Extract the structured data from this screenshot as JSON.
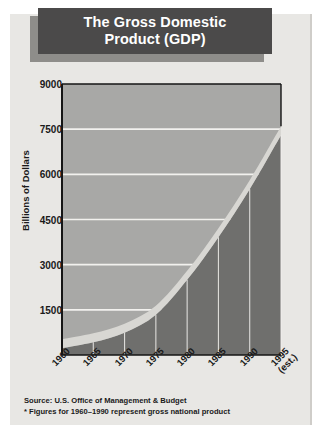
{
  "title": {
    "line1": "The Gross Domestic",
    "line2": "Product (GDP)"
  },
  "footnotes": {
    "source": "Source: U.S. Office of Management & Budget",
    "figures": "* Figures for 1960–1990 represent gross national product"
  },
  "colors": {
    "title_bg": "#4b4a4a",
    "title_shadow": "#8e8d8a",
    "title_text": "#ffffff",
    "panel_bg": "#e8e7e4",
    "plot_bg": "#a8a8a6",
    "area_fill": "#6f6f6d",
    "band_top": "#d8d7d3",
    "gridline": "#f2f1ee",
    "axis": "#151515"
  },
  "chart_data": {
    "type": "area",
    "title": "The Gross Domestic Product (GDP)",
    "xlabel": "",
    "ylabel": "Billions of Dollars",
    "categories": [
      "1960",
      "1965",
      "1970",
      "1975",
      "1980",
      "1985",
      "1990",
      "1995 (est.)"
    ],
    "x_tick_labels": [
      "1960",
      "1965",
      "1970",
      "1975",
      "1980",
      "1985",
      "1990",
      "1995"
    ],
    "x_tick_sublabels": [
      "",
      "",
      "",
      "",
      "",
      "",
      "",
      "(est.)"
    ],
    "values": [
      526,
      720,
      1039,
      1636,
      2796,
      4213,
      5803,
      7600
    ],
    "y_tick_labels": [
      "1500",
      "3000",
      "4500",
      "6000",
      "7500",
      "9000"
    ],
    "y_ticks": [
      1500,
      3000,
      4500,
      6000,
      7500,
      9000
    ],
    "ylim": [
      0,
      9000
    ],
    "grid": true,
    "legend": "none"
  }
}
